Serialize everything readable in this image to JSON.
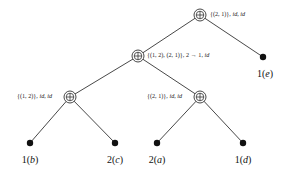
{
  "diagram": {
    "type": "tree",
    "nodes": [
      {
        "id": "root",
        "kind": "oplus",
        "label": "{(2, 1)}, id, id",
        "x": 200,
        "y": 15
      },
      {
        "id": "mid",
        "kind": "oplus",
        "label": "{(1, 2), (2, 1)}, 2 → 1, id",
        "x": 138,
        "y": 56
      },
      {
        "id": "left",
        "kind": "oplus",
        "label": "{(1, 2)}, id, id",
        "x": 70,
        "y": 97
      },
      {
        "id": "right",
        "kind": "oplus",
        "label": "{(2, 1)}, id, id",
        "x": 200,
        "y": 97
      },
      {
        "id": "leaf_e",
        "kind": "leaf",
        "label": "1(e)",
        "x": 263,
        "y": 57
      },
      {
        "id": "leaf_b",
        "kind": "leaf",
        "label": "1(b)",
        "x": 30,
        "y": 143
      },
      {
        "id": "leaf_c",
        "kind": "leaf",
        "label": "2(c)",
        "x": 115,
        "y": 143
      },
      {
        "id": "leaf_a",
        "kind": "leaf",
        "label": "2(a)",
        "x": 157,
        "y": 143
      },
      {
        "id": "leaf_d",
        "kind": "leaf",
        "label": "1(d)",
        "x": 243,
        "y": 143
      }
    ],
    "edges": [
      [
        "root",
        "mid"
      ],
      [
        "root",
        "leaf_e"
      ],
      [
        "mid",
        "left"
      ],
      [
        "mid",
        "right"
      ],
      [
        "left",
        "leaf_b"
      ],
      [
        "left",
        "leaf_c"
      ],
      [
        "right",
        "leaf_a"
      ],
      [
        "right",
        "leaf_d"
      ]
    ],
    "labels": {
      "root": {
        "set": "{(2, 1)}, ",
        "f1": "id",
        "sep": ", ",
        "f2": "id"
      },
      "mid": {
        "set": "{(1, 2), (2, 1)}, 2 → 1, ",
        "f2": "id"
      },
      "left": {
        "set": "{(1, 2)}, ",
        "f1": "id",
        "sep": ", ",
        "f2": "id"
      },
      "right": {
        "set": "{(2, 1)}, ",
        "f1": "id",
        "sep": ", ",
        "f2": "id"
      },
      "leaf_e": {
        "num": "1",
        "var": "e"
      },
      "leaf_b": {
        "num": "1",
        "var": "b"
      },
      "leaf_c": {
        "num": "2",
        "var": "c"
      },
      "leaf_a": {
        "num": "2",
        "var": "a"
      },
      "leaf_d": {
        "num": "1",
        "var": "d"
      }
    }
  }
}
